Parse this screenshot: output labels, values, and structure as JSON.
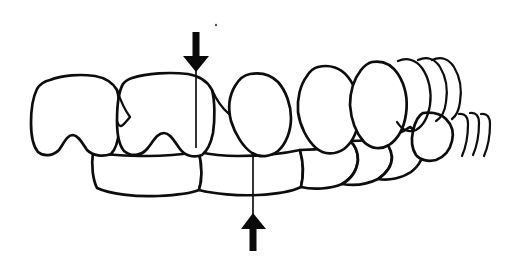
{
  "figure": {
    "title": "Dental occlusion line drawing with midline arrows",
    "background_color": "#ffffff",
    "ink_color": "#0d0d0d",
    "width": 509,
    "height": 279
  },
  "annotations": {
    "upper_midline_arrow": {
      "name": "maxillary-midline-arrow",
      "direction": "down",
      "x": 196,
      "tip_y": 72,
      "tail_y": 32,
      "rule_end_y": 148,
      "color": "#0a0a0a"
    },
    "lower_midline_arrow": {
      "name": "mandibular-midline-arrow",
      "direction": "up",
      "x": 253,
      "tip_y": 213,
      "tail_y": 250,
      "rule_end_y": 152,
      "color": "#0a0a0a"
    },
    "speck": {
      "x": 216,
      "y": 25,
      "r": 1.2
    }
  },
  "upper_arch": {
    "label": "Maxillary arch",
    "teeth": [
      {
        "name": "upper-tooth-1",
        "label": "upper left molar"
      },
      {
        "name": "upper-tooth-2",
        "label": "upper left premolar"
      },
      {
        "name": "upper-tooth-3",
        "label": "upper right central incisor"
      },
      {
        "name": "upper-tooth-4",
        "label": "upper right lateral incisor"
      },
      {
        "name": "upper-tooth-5",
        "label": "upper right canine"
      },
      {
        "name": "upper-tooth-6",
        "label": "upper right first premolar"
      },
      {
        "name": "upper-tooth-7",
        "label": "upper right second premolar"
      },
      {
        "name": "upper-tooth-8",
        "label": "upper right molar"
      }
    ]
  },
  "lower_arch": {
    "label": "Mandibular arch",
    "teeth": [
      {
        "name": "lower-tooth-1",
        "label": "lower left incisor block"
      },
      {
        "name": "lower-tooth-2",
        "label": "lower right incisor"
      },
      {
        "name": "lower-tooth-3",
        "label": "lower right canine"
      },
      {
        "name": "lower-tooth-4",
        "label": "lower right premolar"
      },
      {
        "name": "lower-tooth-5",
        "label": "lower right molar"
      },
      {
        "name": "lower-tooth-6",
        "label": "lower right distal molar"
      }
    ]
  }
}
